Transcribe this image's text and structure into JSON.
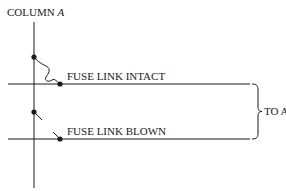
{
  "diagram": {
    "column_label": "COLUMN",
    "column_letter": "A",
    "rows": [
      {
        "label": "FUSE LINK INTACT",
        "state": "intact"
      },
      {
        "label": "FUSE LINK BLOWN",
        "state": "blown"
      }
    ],
    "output_label": "TO AND GATES",
    "colors": {
      "line": "#1a1a1a",
      "background": "#ffffff"
    }
  }
}
